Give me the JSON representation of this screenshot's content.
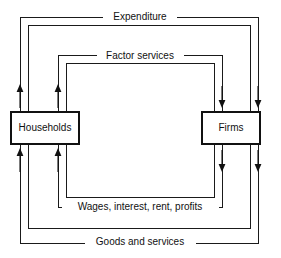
{
  "diagram": {
    "type": "circular-flow",
    "background_color": "#ffffff",
    "line_color": "#111111",
    "agents": [
      {
        "id": "households",
        "label": "Households",
        "side": "left",
        "x": 11,
        "y": 112,
        "width": 68,
        "height": 32
      },
      {
        "id": "firms",
        "label": "Firms",
        "side": "right",
        "x": 202,
        "y": 112,
        "width": 58,
        "height": 32
      }
    ],
    "flows": [
      {
        "id": "expenditure",
        "label": "Expenditure",
        "position": "outer-top",
        "direction": "households-to-firms",
        "loop_index": 1,
        "label_x": 140,
        "label_y": 17
      },
      {
        "id": "factor-services",
        "label": "Factor services",
        "position": "inner-top",
        "direction": "households-to-firms",
        "loop_index": 3,
        "label_x": 140,
        "label_y": 56
      },
      {
        "id": "wages-interest-rent-profits",
        "label": "Wages, interest, rent, profits",
        "position": "inner-bottom",
        "direction": "firms-to-households",
        "loop_index": 3,
        "label_x": 140,
        "label_y": 207
      },
      {
        "id": "goods-and-services",
        "label": "Goods and services",
        "position": "outer-bottom",
        "direction": "firms-to-households",
        "loop_index": 1,
        "label_x": 140,
        "label_y": 242
      }
    ],
    "loops": [
      {
        "index": 1,
        "left": 20,
        "right": 258,
        "top": 17,
        "bottom": 243
      },
      {
        "index": 2,
        "left": 28,
        "right": 250,
        "top": 25,
        "bottom": 228
      },
      {
        "index": 3,
        "left": 58,
        "right": 222,
        "top": 55,
        "bottom": 207
      },
      {
        "index": 4,
        "left": 66,
        "right": 214,
        "top": 63,
        "bottom": 197
      }
    ],
    "arrows": [
      {
        "id": "left-outer-upper",
        "x": 20,
        "y_start": 108,
        "y_end": 86,
        "direction": "up"
      },
      {
        "id": "left-inner-upper",
        "x": 58,
        "y_start": 108,
        "y_end": 86,
        "direction": "up"
      },
      {
        "id": "left-outer-lower",
        "x": 20,
        "y_start": 172,
        "y_end": 150,
        "direction": "up"
      },
      {
        "id": "left-inner-lower",
        "x": 58,
        "y_start": 172,
        "y_end": 150,
        "direction": "up"
      },
      {
        "id": "right-inner-upper",
        "x": 222,
        "y_start": 86,
        "y_end": 108,
        "direction": "down"
      },
      {
        "id": "right-outer-upper",
        "x": 258,
        "y_start": 86,
        "y_end": 108,
        "direction": "down"
      },
      {
        "id": "right-inner-lower",
        "x": 222,
        "y_start": 150,
        "y_end": 172,
        "direction": "down"
      },
      {
        "id": "right-outer-lower",
        "x": 258,
        "y_start": 150,
        "y_end": 172,
        "direction": "down"
      }
    ]
  }
}
